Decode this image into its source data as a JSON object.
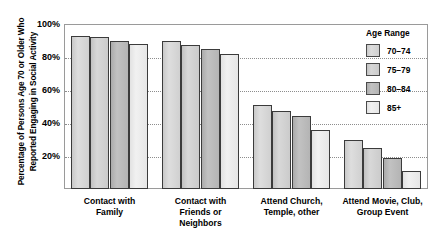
{
  "chart_data": {
    "type": "bar",
    "title": "",
    "xlabel": "",
    "ylabel": "Percentage of Persons Age 70 or Older Who\nReported Engaging in Social Activity",
    "ylim": [
      0,
      100
    ],
    "ytick_labels": [
      "100%",
      "80%",
      "60%",
      "40%",
      "20%"
    ],
    "ytick_values": [
      100,
      80,
      60,
      40,
      20
    ],
    "grid": "horizontal-dotted",
    "legend_position": "right",
    "legend_title": "Age Range",
    "categories": [
      "Contact with\nFamily",
      "Contact with\nFriends or\nNeighbors",
      "Attend Church,\nTemple, other",
      "Attend Movie, Club,\nGroup Event"
    ],
    "series": [
      {
        "name": "70–74",
        "values": [
          93,
          90,
          51,
          30
        ]
      },
      {
        "name": "75–79",
        "values": [
          92,
          87,
          47,
          25
        ]
      },
      {
        "name": "80–84",
        "values": [
          90,
          85,
          44,
          19
        ]
      },
      {
        "name": "85+",
        "values": [
          88,
          82,
          36,
          11
        ]
      }
    ],
    "colors": {
      "series_70_74": "#d5d5d5",
      "series_75_79": "#cfcfcf",
      "series_80_84": "#b7b7b7",
      "series_85_plus": "#ececec",
      "bar_outline": "#3b3b3b",
      "gridline": "#8d8d8d",
      "plot_border": "#9a9a9a",
      "background": "#ffffff",
      "text": "#000000"
    }
  }
}
